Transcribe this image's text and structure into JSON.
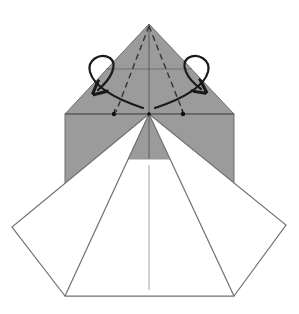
{
  "diagram": {
    "type": "origami-folding-step",
    "description": "Origami step: gray paper with white pentagonal flap unfolded below; two curved arrows indicate folding the upper triangle edges outward along dashed valley lines",
    "colors": {
      "paper_gray": "#9b9b9b",
      "paper_white": "#ffffff",
      "edge": "#6f6f6f",
      "crease": "#555555",
      "arrow": "#1a1a1a",
      "background": "#ffffff"
    },
    "shapes": {
      "top_triangle": [
        [
          149,
          24
        ],
        [
          65,
          114
        ],
        [
          234,
          114
        ]
      ],
      "gray_rectangle": [
        [
          65,
          114
        ],
        [
          234,
          114
        ],
        [
          234,
          296
        ],
        [
          65,
          296
        ]
      ],
      "white_pentagon": [
        [
          149,
          114
        ],
        [
          12,
          227
        ],
        [
          65,
          296
        ],
        [
          234,
          296
        ],
        [
          286,
          225
        ]
      ],
      "inner_gray_trapezoid": [
        [
          149,
          114
        ],
        [
          128,
          159
        ],
        [
          170,
          159
        ]
      ],
      "center_crease": {
        "x": 149,
        "y1": 24,
        "y2": 159
      },
      "lower_center_line": {
        "x": 149,
        "y1": 165,
        "y2": 290
      },
      "horizontal_crease": {
        "y": 69,
        "x1": 106,
        "x2": 192
      },
      "shoulder_line": {
        "y": 114,
        "x1": 65,
        "x2": 234
      },
      "dashed_left": [
        [
          149,
          24
        ],
        [
          116,
          112
        ]
      ],
      "dashed_right": [
        [
          149,
          24
        ],
        [
          183,
          112
        ]
      ],
      "inner_flap_lines": [
        [
          [
            149,
            114
          ],
          [
            65,
            296
          ]
        ],
        [
          [
            149,
            114
          ],
          [
            234,
            296
          ]
        ]
      ]
    },
    "markers": {
      "dots": [
        [
          114,
          114
        ],
        [
          182,
          114
        ],
        [
          149,
          114
        ]
      ]
    },
    "arrows": [
      {
        "name": "left-fold-arrow",
        "direction": "outward-left"
      },
      {
        "name": "right-fold-arrow",
        "direction": "outward-right"
      }
    ]
  }
}
